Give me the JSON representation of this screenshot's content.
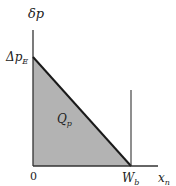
{
  "diagram": {
    "y_axis_label": "δp",
    "x_axis_label_main": "x",
    "x_axis_label_sub": "n",
    "y_intercept_label_main": "Δp",
    "y_intercept_label_sub": "E",
    "x_intercept_label_main": "W",
    "x_intercept_label_sub": "b",
    "origin_label": "0",
    "area_label_main": "Q",
    "area_label_sub": "p",
    "colors": {
      "fill": "#b3b3b3",
      "line": "#1a1a1a",
      "axis": "#333333",
      "background": "#ffffff"
    }
  }
}
